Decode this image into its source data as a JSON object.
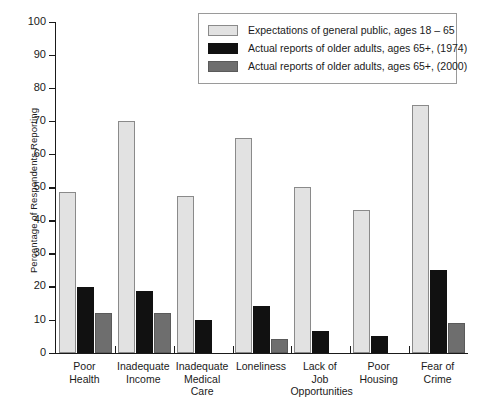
{
  "chart_data": {
    "type": "bar",
    "title": "",
    "xlabel": "",
    "ylabel": "Percentage of Respondents Reporting",
    "ylim": [
      0,
      100
    ],
    "ytick_step": 10,
    "yticks": [
      0,
      10,
      20,
      30,
      40,
      50,
      60,
      70,
      80,
      90,
      100
    ],
    "grid": false,
    "legend_position": "top-right",
    "categories": [
      "Poor Health",
      "Inadequate Income",
      "Inadequate Medical Care",
      "Loneliness",
      "Lack of Job Opportunities",
      "Poor Housing",
      "Fear of Crime"
    ],
    "category_lines": [
      [
        "Poor",
        "Health"
      ],
      [
        "Inadequate",
        "Income"
      ],
      [
        "Inadequate",
        "Medical",
        "Care"
      ],
      [
        "Loneliness"
      ],
      [
        "Lack of",
        "Job",
        "Opportunities"
      ],
      [
        "Poor",
        "Housing"
      ],
      [
        "Fear of",
        "Crime"
      ]
    ],
    "series": [
      {
        "name": "Expectations of general public, ages 18 – 65",
        "color": "#e2e2e2",
        "values": [
          48.5,
          70,
          47.5,
          65,
          50,
          43,
          75
        ]
      },
      {
        "name": "Actual reports of older adults, ages 65+, (1974)",
        "color": "#111111",
        "values": [
          20,
          18.5,
          10,
          14,
          6.5,
          5,
          25
        ]
      },
      {
        "name": "Actual reports of older adults, ages 65+, (2000)",
        "color": "#6e6e6e",
        "values": [
          12,
          12,
          null,
          4,
          null,
          null,
          9
        ]
      }
    ]
  },
  "colors": {
    "series_light": "#e2e2e2",
    "series_black": "#111111",
    "series_dark": "#6e6e6e",
    "axis": "#1a1a1a",
    "background": "#ffffff",
    "legend_border": "#9a9a9a"
  }
}
